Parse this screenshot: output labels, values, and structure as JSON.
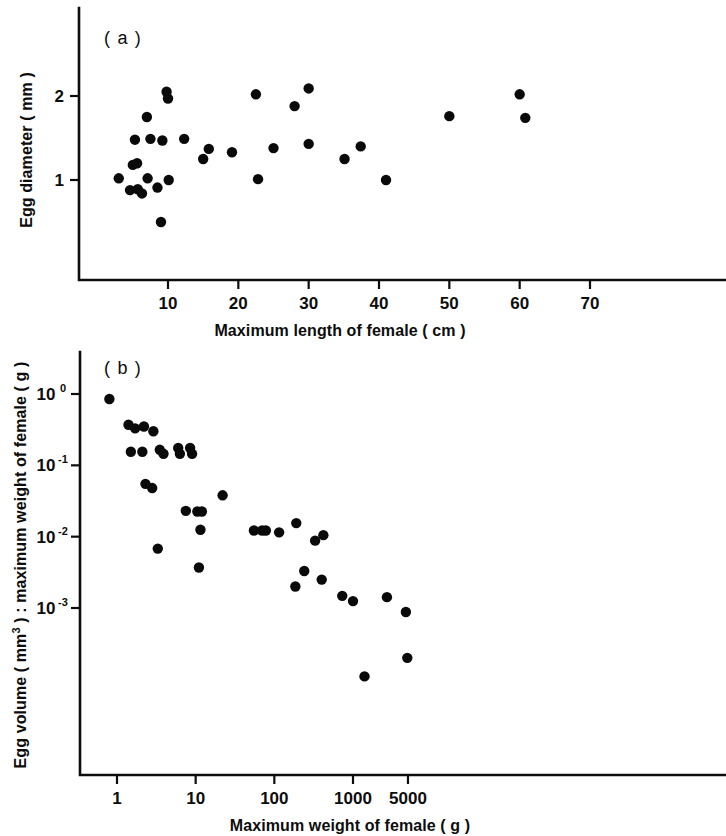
{
  "figure": {
    "background_color": "#ffffff",
    "ink_color": "#0d0d0d",
    "point_color": "#0a0a0a"
  },
  "panel_a": {
    "label": "( a )",
    "xlabel": "Maximum length of female ( cm )",
    "ylabel": "Egg diameter ( mm )",
    "xticks": [
      "10",
      "20",
      "30",
      "40",
      "50",
      "60",
      "70"
    ],
    "yticks": [
      "1",
      "2"
    ]
  },
  "panel_b": {
    "label": "( b )",
    "xlabel": "Maximum weight of female ( g )",
    "ylabel_part1": "Egg volume ( mm",
    "ylabel_sup": "3",
    "ylabel_part2": " ) : maximum weight of female ( g )",
    "xticks": [
      "1",
      "10",
      "100",
      "1000",
      "5000"
    ],
    "yticks": [
      "10",
      "10",
      "10",
      "10"
    ],
    "ytick_exponents": [
      "0",
      "-1",
      "-2",
      "-3"
    ]
  },
  "chart_data": [
    {
      "type": "scatter",
      "panel": "( a )",
      "title": "",
      "xlabel": "Maximum length of female ( cm )",
      "ylabel": "Egg diameter ( mm )",
      "xscale": "linear",
      "yscale": "linear",
      "xlim": [
        0,
        73
      ],
      "ylim": [
        0.3,
        2.45
      ],
      "xticks": [
        10,
        20,
        30,
        40,
        50,
        60,
        70
      ],
      "yticks": [
        1,
        2
      ],
      "grid": false,
      "legend": "none",
      "marker": "filled-circle",
      "points": [
        {
          "x": 3.0,
          "y": 1.02
        },
        {
          "x": 4.6,
          "y": 0.88
        },
        {
          "x": 5.0,
          "y": 1.18
        },
        {
          "x": 5.3,
          "y": 1.48
        },
        {
          "x": 5.6,
          "y": 1.2
        },
        {
          "x": 5.7,
          "y": 0.89
        },
        {
          "x": 6.3,
          "y": 0.84
        },
        {
          "x": 7.0,
          "y": 1.75
        },
        {
          "x": 7.1,
          "y": 1.02
        },
        {
          "x": 7.5,
          "y": 1.49
        },
        {
          "x": 8.5,
          "y": 0.91
        },
        {
          "x": 9.0,
          "y": 0.5
        },
        {
          "x": 9.2,
          "y": 1.47
        },
        {
          "x": 9.8,
          "y": 2.05
        },
        {
          "x": 10.0,
          "y": 1.97
        },
        {
          "x": 10.1,
          "y": 1.0
        },
        {
          "x": 12.3,
          "y": 1.49
        },
        {
          "x": 15.0,
          "y": 1.25
        },
        {
          "x": 15.8,
          "y": 1.37
        },
        {
          "x": 19.1,
          "y": 1.33
        },
        {
          "x": 22.5,
          "y": 2.02
        },
        {
          "x": 22.8,
          "y": 1.01
        },
        {
          "x": 25.0,
          "y": 1.38
        },
        {
          "x": 28.0,
          "y": 1.88
        },
        {
          "x": 30.0,
          "y": 2.09
        },
        {
          "x": 30.0,
          "y": 1.43
        },
        {
          "x": 35.1,
          "y": 1.25
        },
        {
          "x": 37.4,
          "y": 1.4
        },
        {
          "x": 41.0,
          "y": 1.0
        },
        {
          "x": 50.0,
          "y": 1.76
        },
        {
          "x": 60.0,
          "y": 2.02
        },
        {
          "x": 60.8,
          "y": 1.74
        }
      ]
    },
    {
      "type": "scatter",
      "panel": "( b )",
      "title": "",
      "xlabel": "Maximum weight of female ( g )",
      "ylabel": "Egg volume ( mm3 ) : maximum weight of female ( g )",
      "xscale": "log",
      "yscale": "log",
      "xlim": [
        0.55,
        11000
      ],
      "ylim": [
        2e-05,
        1.6
      ],
      "xticks": [
        1,
        10,
        100,
        1000,
        5000
      ],
      "yticks": [
        1,
        0.1,
        0.01,
        0.001
      ],
      "ytick_labels": [
        "10^0",
        "10^-1",
        "10^-2",
        "10^-3"
      ],
      "grid": false,
      "legend": "none",
      "marker": "filled-circle",
      "points": [
        {
          "x": 0.8,
          "y": 0.85
        },
        {
          "x": 1.4,
          "y": 0.37
        },
        {
          "x": 1.7,
          "y": 0.33
        },
        {
          "x": 1.5,
          "y": 0.155
        },
        {
          "x": 2.1,
          "y": 0.155
        },
        {
          "x": 2.2,
          "y": 0.35
        },
        {
          "x": 2.9,
          "y": 0.3
        },
        {
          "x": 3.5,
          "y": 0.165
        },
        {
          "x": 3.9,
          "y": 0.145
        },
        {
          "x": 6.0,
          "y": 0.175
        },
        {
          "x": 6.3,
          "y": 0.145
        },
        {
          "x": 8.5,
          "y": 0.175
        },
        {
          "x": 9.0,
          "y": 0.145
        },
        {
          "x": 2.3,
          "y": 0.055
        },
        {
          "x": 2.8,
          "y": 0.048
        },
        {
          "x": 3.3,
          "y": 0.0068
        },
        {
          "x": 7.5,
          "y": 0.023
        },
        {
          "x": 10.5,
          "y": 0.0225
        },
        {
          "x": 12.0,
          "y": 0.0225
        },
        {
          "x": 11.5,
          "y": 0.0125
        },
        {
          "x": 11.0,
          "y": 0.0037
        },
        {
          "x": 22.0,
          "y": 0.038
        },
        {
          "x": 55.0,
          "y": 0.0122
        },
        {
          "x": 70.0,
          "y": 0.0122
        },
        {
          "x": 78.0,
          "y": 0.0122
        },
        {
          "x": 115.0,
          "y": 0.0115
        },
        {
          "x": 190.0,
          "y": 0.0155
        },
        {
          "x": 185.0,
          "y": 0.002
        },
        {
          "x": 240.0,
          "y": 0.0033
        },
        {
          "x": 330.0,
          "y": 0.0088
        },
        {
          "x": 420.0,
          "y": 0.0105
        },
        {
          "x": 400.0,
          "y": 0.0025
        },
        {
          "x": 730.0,
          "y": 0.00148
        },
        {
          "x": 1000.0,
          "y": 0.00125
        },
        {
          "x": 1400.0,
          "y": 0.00011
        },
        {
          "x": 2700.0,
          "y": 0.00142
        },
        {
          "x": 4700.0,
          "y": 0.00088
        },
        {
          "x": 4900.0,
          "y": 0.0002
        }
      ]
    }
  ]
}
